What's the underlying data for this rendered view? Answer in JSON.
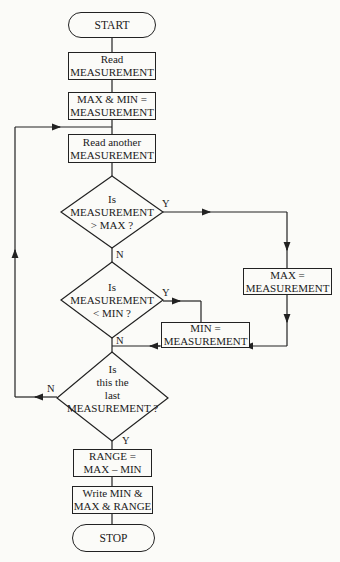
{
  "flowchart": {
    "start": "START",
    "read": [
      "Read",
      "MEASUREMENT"
    ],
    "init": [
      "MAX & MIN =",
      "MEASUREMENT"
    ],
    "read_another": [
      "Read another",
      "MEASUREMENT"
    ],
    "decision_max": [
      "Is",
      "MEASUREMENT",
      "> MAX ?"
    ],
    "decision_min": [
      "Is",
      "MEASUREMENT",
      "< MIN ?"
    ],
    "set_max": [
      "MAX =",
      "MEASUREMENT"
    ],
    "set_min": [
      "MIN =",
      "MEASUREMENT"
    ],
    "decision_last": [
      "Is",
      "this the",
      "last",
      "MEASUREMENT ?"
    ],
    "range": [
      "RANGE =",
      "MAX – MIN"
    ],
    "write": [
      "Write MIN &",
      "MAX & RANGE"
    ],
    "stop": "STOP",
    "labels": {
      "max_yes": "Y",
      "max_no": "N",
      "min_yes": "Y",
      "min_no": "N",
      "last_yes": "Y",
      "last_no": "N"
    }
  }
}
